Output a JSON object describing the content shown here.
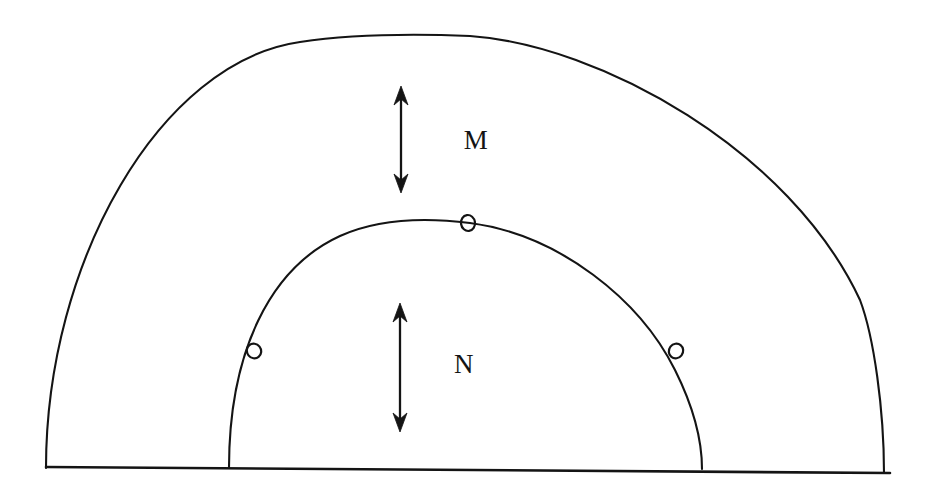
{
  "figure": {
    "background_color": "#ffffff",
    "stroke_color": "#141414",
    "width": 934,
    "height": 499
  },
  "labels": {
    "outer_region": "M",
    "inner_region": "N"
  },
  "diagram_data": {
    "type": "diagram",
    "baseline": {
      "name": "baseline",
      "x1": 46,
      "y1": 467,
      "x2": 890,
      "y2": 473
    },
    "arcs": [
      {
        "name": "outer-arc",
        "label": "M",
        "center_x": 465,
        "center_y": 470,
        "radius_x": 419,
        "radius_y": 436,
        "apex_x": 455,
        "apex_y": 34,
        "left_base_x": 46,
        "right_base_x": 884
      },
      {
        "name": "inner-arc",
        "label": "N",
        "center_x": 465,
        "center_y": 468,
        "radius_x": 237,
        "radius_y": 246,
        "apex_x": 468,
        "apex_y": 222,
        "left_base_x": 229,
        "right_base_x": 702
      }
    ],
    "nodes": [
      {
        "name": "node-top",
        "x": 468,
        "y": 223,
        "rx": 7.0,
        "ry": 8.0,
        "rotation": -8
      },
      {
        "name": "node-left",
        "x": 254,
        "y": 351,
        "rx": 7.0,
        "ry": 7.5,
        "rotation": -38
      },
      {
        "name": "node-right",
        "x": 676,
        "y": 351,
        "rx": 7.0,
        "ry": 7.5,
        "rotation": 38
      }
    ],
    "arrows": [
      {
        "name": "arrow-m",
        "label": "M",
        "x": 401,
        "y_top": 86,
        "y_bottom": 193,
        "double_headed": true,
        "length": 107
      },
      {
        "name": "arrow-n",
        "label": "N",
        "x": 400,
        "y_top": 303,
        "y_bottom": 432,
        "double_headed": true,
        "length": 129
      }
    ],
    "text_labels": [
      {
        "name": "label-m",
        "text": "M",
        "x": 476,
        "y": 143
      },
      {
        "name": "label-n",
        "text": "N",
        "x": 464,
        "y": 367
      }
    ]
  }
}
